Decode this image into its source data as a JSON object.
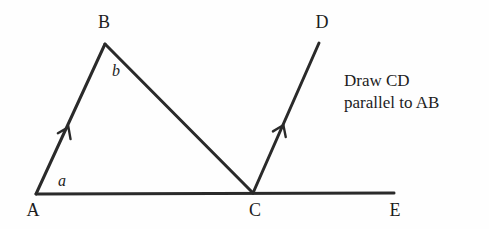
{
  "figure": {
    "type": "geometry-diagram",
    "background_color": "#fefefe",
    "stroke_color": "#2a2a2a",
    "text_color": "#1d1d1d",
    "stroke_width": 3,
    "width": 489,
    "height": 229,
    "points": {
      "A": {
        "x": 36,
        "y": 194
      },
      "B": {
        "x": 105,
        "y": 44
      },
      "C": {
        "x": 253,
        "y": 193
      },
      "D": {
        "x": 319,
        "y": 43
      },
      "E": {
        "x": 394,
        "y": 193
      }
    },
    "segments": [
      {
        "name": "AB",
        "from": "A",
        "to": "B",
        "arrow_marker": true
      },
      {
        "name": "BC",
        "from": "B",
        "to": "C",
        "arrow_marker": false
      },
      {
        "name": "CD",
        "from": "C",
        "to": "D",
        "arrow_marker": true
      },
      {
        "name": "AE",
        "from": "A",
        "to": "E",
        "arrow_marker": false
      }
    ],
    "arrow_markers": [
      {
        "on": "AB",
        "x": 68,
        "y": 128,
        "angle_deg": -65
      },
      {
        "on": "CD",
        "x": 283,
        "y": 126,
        "angle_deg": -66
      }
    ],
    "vertex_labels": [
      {
        "id": "A",
        "text": "A",
        "x": 33,
        "y": 210
      },
      {
        "id": "B",
        "text": "B",
        "x": 104,
        "y": 22
      },
      {
        "id": "C",
        "text": "C",
        "x": 255,
        "y": 210
      },
      {
        "id": "D",
        "text": "D",
        "x": 322,
        "y": 22
      },
      {
        "id": "E",
        "text": "E",
        "x": 395,
        "y": 210
      }
    ],
    "angle_labels": [
      {
        "id": "a",
        "text": "a",
        "x": 62,
        "y": 181
      },
      {
        "id": "b",
        "text": "b",
        "x": 116,
        "y": 71
      }
    ]
  },
  "instruction": {
    "line1": "Draw CD",
    "line2": "parallel to AB"
  }
}
